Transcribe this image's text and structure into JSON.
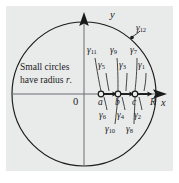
{
  "figure": {
    "kind": "complex-plane-contour-diagram",
    "background_panel_color": "#e9eaea",
    "stroke_color": "#1a1a1a",
    "note": {
      "line1": "Small circles",
      "line2a": "have radius ",
      "line2b": "r",
      "line2c": "."
    },
    "axes": {
      "x_label": "x",
      "y_label": "y",
      "origin_label": "0",
      "radius_label": "R"
    },
    "points": [
      {
        "label": "a",
        "x": 101,
        "y": 94
      },
      {
        "label": "b",
        "x": 118,
        "y": 94
      },
      {
        "label": "c",
        "x": 135,
        "y": 94
      }
    ],
    "big_circle": {
      "center_x": 84,
      "center_y": 94,
      "radius": 72,
      "label": "γ12",
      "label_base": "γ",
      "label_sub": "12"
    },
    "gamma_labels_upper": [
      {
        "base": "γ",
        "sub": "11",
        "x": 88,
        "y": 52
      },
      {
        "base": "γ",
        "sub": "9",
        "x": 110,
        "y": 52
      },
      {
        "base": "γ",
        "sub": "7",
        "x": 130,
        "y": 52
      },
      {
        "base": "γ",
        "sub": "5",
        "x": 98,
        "y": 67
      },
      {
        "base": "γ",
        "sub": "3",
        "x": 118,
        "y": 67
      },
      {
        "base": "γ",
        "sub": "1",
        "x": 136,
        "y": 67
      }
    ],
    "gamma_labels_lower": [
      {
        "base": "γ",
        "sub": "6",
        "x": 99,
        "y": 110
      },
      {
        "base": "γ",
        "sub": "4",
        "x": 117,
        "y": 110
      },
      {
        "base": "γ",
        "sub": "2",
        "x": 134,
        "y": 110
      },
      {
        "base": "γ",
        "sub": "10",
        "x": 106,
        "y": 124
      },
      {
        "base": "γ",
        "sub": "8",
        "x": 126,
        "y": 124
      }
    ]
  }
}
